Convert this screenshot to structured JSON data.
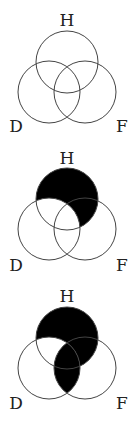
{
  "diagrams": [
    {
      "labels": {
        "top": "H",
        "left": "D",
        "right": "F"
      },
      "shaded_regions": [],
      "description": "Three overlapping circles H, D, F with no shading"
    },
    {
      "labels": {
        "top": "H",
        "left": "D",
        "right": "F"
      },
      "shaded_regions": [
        "H only",
        "H and F not D"
      ],
      "description": "Region of H outside D is shaded black"
    },
    {
      "labels": {
        "top": "H",
        "left": "D",
        "right": "F"
      },
      "shaded_regions": [
        "H only",
        "H and F not D",
        "H and D and F",
        "D and F not H"
      ],
      "description": "Region of H outside D plus the D-F intersection is shaded black"
    }
  ],
  "colors": {
    "shade": "#000000",
    "stroke": "#444444",
    "background": "#ffffff"
  }
}
